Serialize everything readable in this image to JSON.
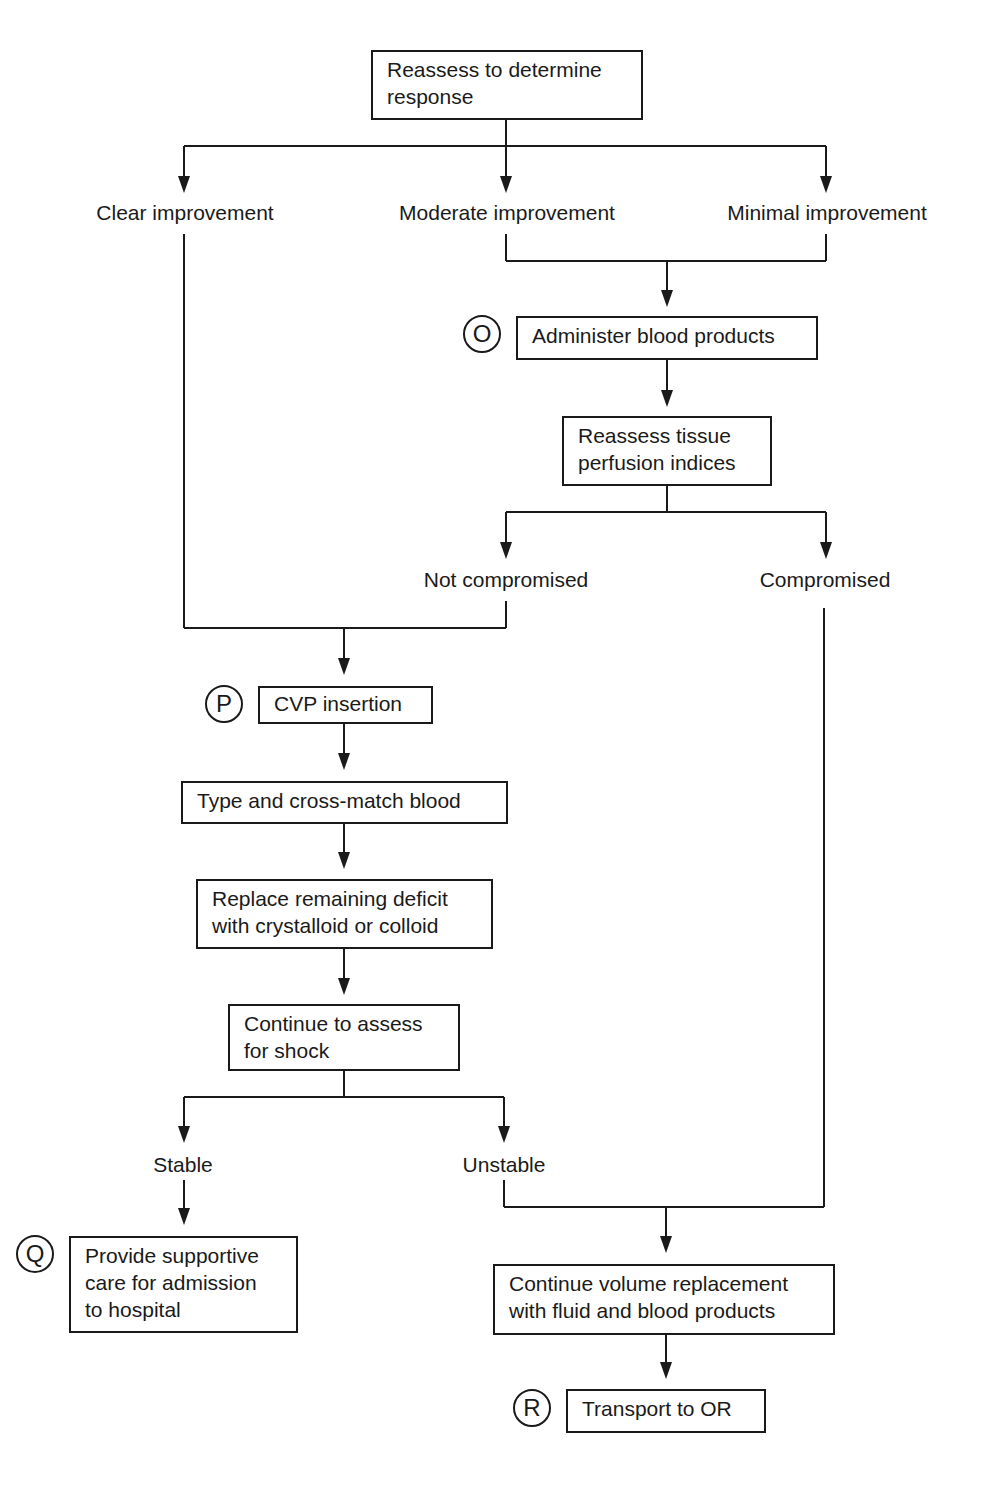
{
  "diagram": {
    "type": "flowchart",
    "nodes": {
      "reassess_response": {
        "text": "Reassess to determine response"
      },
      "administer_blood": {
        "text": "Administer blood products",
        "marker": "O"
      },
      "reassess_perfusion": {
        "text": "Reassess tissue perfusion indices"
      },
      "cvp_insertion": {
        "text": "CVP insertion",
        "marker": "P"
      },
      "type_crossmatch": {
        "text": "Type and cross-match blood"
      },
      "replace_deficit": {
        "text": "Replace remaining deficit with crystalloid or colloid"
      },
      "continue_assess": {
        "text": "Continue to assess for shock"
      },
      "supportive_care": {
        "text": "Provide supportive care for admission to hospital",
        "marker": "Q"
      },
      "continue_volume": {
        "text": "Continue volume replacement with fluid and blood products"
      },
      "transport_or": {
        "text": "Transport to OR",
        "marker": "R"
      }
    },
    "branch_labels": {
      "clear": "Clear improvement",
      "moderate": "Moderate improvement",
      "minimal": "Minimal improvement",
      "not_compromised": "Not compromised",
      "compromised": "Compromised",
      "stable": "Stable",
      "unstable": "Unstable"
    },
    "lines": {
      "reassess_response": [
        "Reassess to determine",
        "response"
      ],
      "reassess_perfusion": [
        "Reassess tissue",
        "perfusion indices"
      ],
      "replace_deficit": [
        "Replace remaining deficit",
        "with crystalloid or colloid"
      ],
      "continue_assess": [
        "Continue to assess",
        "for shock"
      ],
      "supportive_care": [
        "Provide supportive",
        "care for admission",
        "to hospital"
      ],
      "continue_volume": [
        "Continue volume replacement",
        "with fluid and blood products"
      ]
    },
    "edges": [
      [
        "reassess_response",
        "clear"
      ],
      [
        "reassess_response",
        "moderate"
      ],
      [
        "reassess_response",
        "minimal"
      ],
      [
        "moderate",
        "administer_blood"
      ],
      [
        "minimal",
        "administer_blood"
      ],
      [
        "administer_blood",
        "reassess_perfusion"
      ],
      [
        "reassess_perfusion",
        "not_compromised"
      ],
      [
        "reassess_perfusion",
        "compromised"
      ],
      [
        "clear",
        "cvp_insertion"
      ],
      [
        "not_compromised",
        "cvp_insertion"
      ],
      [
        "cvp_insertion",
        "type_crossmatch"
      ],
      [
        "type_crossmatch",
        "replace_deficit"
      ],
      [
        "replace_deficit",
        "continue_assess"
      ],
      [
        "continue_assess",
        "stable"
      ],
      [
        "continue_assess",
        "unstable"
      ],
      [
        "stable",
        "supportive_care"
      ],
      [
        "unstable",
        "continue_volume"
      ],
      [
        "compromised",
        "continue_volume"
      ],
      [
        "continue_volume",
        "transport_or"
      ]
    ]
  },
  "colors": {
    "ink": "#1a1a1a",
    "background": "#ffffff"
  }
}
